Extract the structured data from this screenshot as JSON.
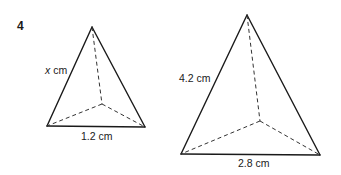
{
  "question": {
    "number": "4"
  },
  "small_pyramid": {
    "slant_label_var": "x",
    "slant_label_unit": " cm",
    "base_label": "1.2 cm"
  },
  "large_pyramid": {
    "slant_label": "4.2 cm",
    "base_label": "2.8 cm"
  }
}
